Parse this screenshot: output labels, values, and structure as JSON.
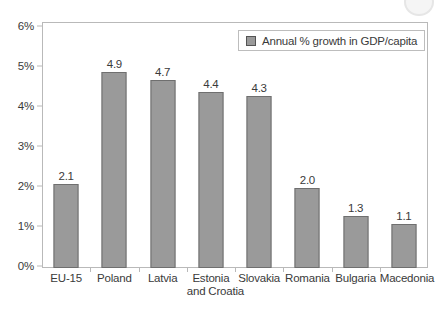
{
  "chart_data": {
    "type": "bar",
    "title": "",
    "xlabel": "",
    "ylabel": "",
    "categories": [
      "EU-15",
      "Poland",
      "Latvia",
      "Estonia",
      "Slovakia",
      "Romania",
      "Bulgaria",
      "Macedonia"
    ],
    "category_lines2": [
      "",
      "",
      "",
      "and Croatia",
      "",
      "",
      "",
      ""
    ],
    "values": [
      2.1,
      4.9,
      4.7,
      4.4,
      4.3,
      2.0,
      1.3,
      1.1
    ],
    "value_labels": [
      "2.1",
      "4.9",
      "4.7",
      "4.4",
      "4.3",
      "2.0",
      "1.3",
      "1.1"
    ],
    "series": [
      {
        "name": "Annual % growth in GDP/capita",
        "values": [
          2.1,
          4.9,
          4.7,
          4.4,
          4.3,
          2.0,
          1.3,
          1.1
        ]
      }
    ],
    "ylim": [
      0,
      6
    ],
    "ytick_values": [
      0,
      1,
      2,
      3,
      4,
      5,
      6
    ],
    "ytick_labels": [
      "0%",
      "1%",
      "2%",
      "3%",
      "4%",
      "5%",
      "6%"
    ],
    "grid": false,
    "legend_position": "top-right",
    "legend_entries": [
      "Annual % growth in GDP/capita"
    ],
    "bar_color": "#9a9a9a",
    "bar_border_color": "#6f6f6f",
    "axis_color": "#b9b9b9",
    "text_color": "#3a3a3a",
    "background_color": "#ffffff"
  },
  "legend": {
    "label": "Annual % growth in GDP/capita"
  }
}
